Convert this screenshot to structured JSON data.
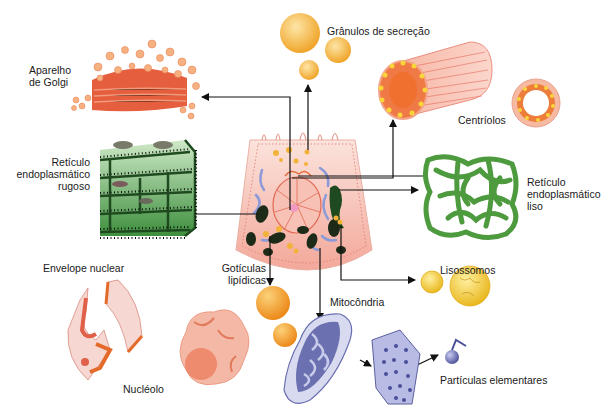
{
  "diagram": {
    "title": "",
    "center": "Célula (corte esquemático)",
    "colors": {
      "background": "#ffffff",
      "arrow": "#111111",
      "text": "#1a1a1a",
      "golgi": "#e0603c",
      "golgi_vesicle": "#f4a877",
      "secretion": "#f3b33a",
      "centriole": "#f6a48e",
      "centriole_core": "#e96a2a",
      "rer": "#4a9a4a",
      "rer_dark": "#1f4a1f",
      "ser": "#4e9a3e",
      "lysosome": "#f3cf3a",
      "lipid": "#f2a230",
      "mito": "#6a70b0",
      "mito_light": "#d8dbf0",
      "envelope": "#f1c0bb",
      "envelope_dark": "#e4602e",
      "nucleolus": "#f09a80",
      "cell": "#f6c6bc"
    },
    "labels": {
      "golgi": "Aparelho\nde Golgi",
      "secretion": "Grânulos de secreção",
      "centrioles": "Centríolos",
      "rer": "Retículo\nendoplasmático\nrugoso",
      "ser": "Retículo\nendoplasmático\nliso",
      "lysosomes": "Lisossomos",
      "lipid": "Gotículas\nlipídicas",
      "envelope": "Envelope nuclear",
      "mitochondria": "Mitocôndria",
      "nucleolus": "Nucléolo",
      "particles": "Partículas elementares"
    },
    "connections": [
      {
        "from": "cell",
        "to": "Aparelho de Golgi"
      },
      {
        "from": "cell",
        "to": "Grânulos de secreção"
      },
      {
        "from": "cell",
        "to": "Centríolos"
      },
      {
        "from": "cell",
        "to": "Retículo endoplasmático rugoso"
      },
      {
        "from": "cell",
        "to": "Retículo endoplasmático liso"
      },
      {
        "from": "cell",
        "to": "Lisossomos"
      },
      {
        "from": "cell",
        "to": "Gotículas lipídicas"
      },
      {
        "from": "cell",
        "to": "Mitocôndria"
      },
      {
        "from": "Mitocôndria",
        "to": "Partículas elementares"
      }
    ]
  }
}
